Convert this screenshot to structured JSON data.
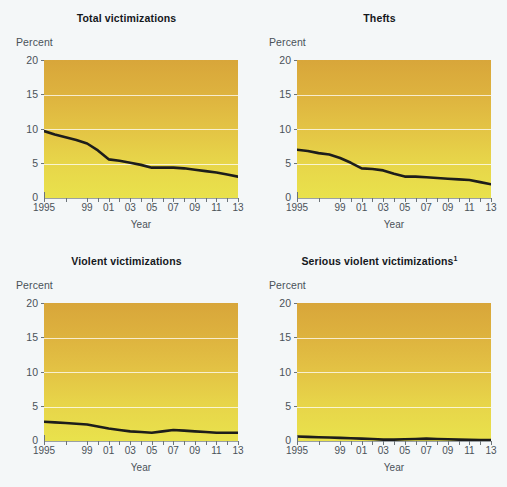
{
  "figure": {
    "background_color": "#f4f7f8",
    "panel_count": 4,
    "axis_xlabel": "Year",
    "axis_ylabel": "Percent",
    "y_ticks": [
      "20",
      "15",
      "10",
      "5",
      "0"
    ],
    "x_ticks": [
      "1995",
      "99",
      "01",
      "03",
      "05",
      "07",
      "09",
      "11",
      "13"
    ],
    "line_color": "#1d1d1b",
    "gradient_top": "#d8a63a",
    "gradient_bottom": "#e9e24c"
  },
  "chart_data": [
    {
      "type": "line",
      "title": "Total victimizations",
      "title_superscript": "",
      "xlabel": "Year",
      "ylabel": "Percent",
      "ylim": [
        0,
        20
      ],
      "xlim": [
        1995,
        2013
      ],
      "grid": true,
      "legend": "none",
      "categories": [
        1995,
        1996,
        1997,
        1998,
        1999,
        2000,
        2001,
        2002,
        2003,
        2004,
        2005,
        2006,
        2007,
        2008,
        2009,
        2010,
        2011,
        2012,
        2013
      ],
      "values": [
        9.7,
        9.2,
        8.8,
        8.4,
        7.9,
        6.9,
        5.6,
        5.4,
        5.1,
        4.8,
        4.4,
        4.4,
        4.4,
        4.3,
        4.1,
        3.9,
        3.7,
        3.4,
        3.1
      ]
    },
    {
      "type": "line",
      "title": "Thefts",
      "title_superscript": "",
      "xlabel": "Year",
      "ylabel": "Percent",
      "ylim": [
        0,
        20
      ],
      "xlim": [
        1995,
        2013
      ],
      "grid": true,
      "legend": "none",
      "categories": [
        1995,
        1996,
        1997,
        1998,
        1999,
        2000,
        2001,
        2002,
        2003,
        2004,
        2005,
        2006,
        2007,
        2008,
        2009,
        2010,
        2011,
        2012,
        2013
      ],
      "values": [
        7.0,
        6.8,
        6.5,
        6.3,
        5.8,
        5.1,
        4.3,
        4.2,
        4.0,
        3.5,
        3.1,
        3.1,
        3.0,
        2.9,
        2.8,
        2.7,
        2.6,
        2.3,
        2.0
      ]
    },
    {
      "type": "line",
      "title": "Violent victimizations",
      "title_superscript": "",
      "xlabel": "Year",
      "ylabel": "Percent",
      "ylim": [
        0,
        20
      ],
      "xlim": [
        1995,
        2013
      ],
      "grid": true,
      "legend": "none",
      "categories": [
        1995,
        1996,
        1997,
        1998,
        1999,
        2000,
        2001,
        2002,
        2003,
        2004,
        2005,
        2006,
        2007,
        2008,
        2009,
        2010,
        2011,
        2012,
        2013
      ],
      "values": [
        2.8,
        2.7,
        2.6,
        2.5,
        2.4,
        2.1,
        1.8,
        1.6,
        1.4,
        1.3,
        1.2,
        1.4,
        1.6,
        1.5,
        1.4,
        1.3,
        1.2,
        1.2,
        1.2
      ]
    },
    {
      "type": "line",
      "title": "Serious violent victimizations",
      "title_superscript": "1",
      "xlabel": "Year",
      "ylabel": "Percent",
      "ylim": [
        0,
        20
      ],
      "xlim": [
        1995,
        2013
      ],
      "grid": true,
      "legend": "none",
      "categories": [
        1995,
        1996,
        1997,
        1998,
        1999,
        2000,
        2001,
        2002,
        2003,
        2004,
        2005,
        2006,
        2007,
        2008,
        2009,
        2010,
        2011,
        2012,
        2013
      ],
      "values": [
        0.65,
        0.6,
        0.55,
        0.5,
        0.45,
        0.4,
        0.35,
        0.3,
        0.2,
        0.2,
        0.25,
        0.3,
        0.35,
        0.3,
        0.25,
        0.2,
        0.18,
        0.15,
        0.12
      ]
    }
  ]
}
